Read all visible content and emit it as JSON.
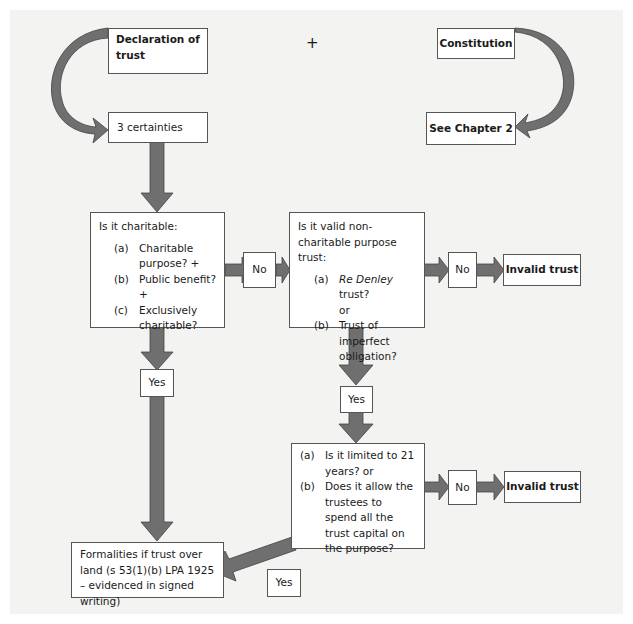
{
  "diagram": {
    "plus_sign": "+",
    "nodes": {
      "declaration": {
        "label": "Declaration of trust"
      },
      "constitution": {
        "label": "Constitution"
      },
      "certainties": {
        "label": "3 certainties"
      },
      "see_chapter": {
        "label": "See Chapter 2"
      },
      "charitable": {
        "title": "Is it charitable:",
        "items": [
          {
            "marker": "(a)",
            "text": "Charitable purpose? +"
          },
          {
            "marker": "(b)",
            "text": "Public benefit? +"
          },
          {
            "marker": "(c)",
            "text": "Exclusively charitable?"
          }
        ]
      },
      "no_1": {
        "label": "No"
      },
      "non_charitable": {
        "title": "Is it valid non-charitable purpose trust:",
        "items": [
          {
            "marker": "(a)",
            "text_italic": "Re Denley",
            "text": " trust?"
          },
          {
            "marker": "",
            "text": "or"
          },
          {
            "marker": "(b)",
            "text": "Trust of imperfect obligation?"
          }
        ]
      },
      "no_2": {
        "label": "No"
      },
      "invalid_1": {
        "label": "Invalid trust"
      },
      "yes_1": {
        "label": "Yes"
      },
      "yes_2": {
        "label": "Yes"
      },
      "limits": {
        "items": [
          {
            "marker": "(a)",
            "text": "Is it limited to 21 years? or"
          },
          {
            "marker": "(b)",
            "text": "Does it allow the trustees to spend all the trust capital on the purpose?"
          }
        ]
      },
      "no_3": {
        "label": "No"
      },
      "invalid_2": {
        "label": "Invalid trust"
      },
      "formalities": {
        "label": "Formalities if trust over land (s 53(1)(b) LPA 1925 – evidenced in signed writing)"
      },
      "yes_3": {
        "label": "Yes"
      }
    },
    "colors": {
      "arrow_fill": "#6f6f6f",
      "arrow_stroke": "#444444",
      "background": "#f3f3f2",
      "box_fill": "#ffffff"
    }
  }
}
